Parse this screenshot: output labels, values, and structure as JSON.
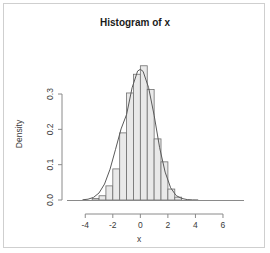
{
  "chart_data": {
    "type": "bar",
    "title": "Histogram of x",
    "xlabel": "x",
    "ylabel": "Density",
    "xlim": [
      -4.6,
      6.8
    ],
    "ylim": [
      0,
      0.385
    ],
    "grid": false,
    "legend": "none",
    "binwidth": 0.5,
    "xticks": [
      -4,
      -2,
      0,
      2,
      4,
      6
    ],
    "xticklabels": [
      "-4",
      "-2",
      "0",
      "2",
      "4",
      "6"
    ],
    "yticks": [
      0.0,
      0.1,
      0.2,
      0.3
    ],
    "yticklabels": [
      "0.0",
      "0.1",
      "0.2",
      "0.3"
    ],
    "bin_starts": [
      -3.5,
      -3.0,
      -2.5,
      -2.0,
      -1.5,
      -1.0,
      -0.5,
      0.0,
      0.5,
      1.0,
      1.5,
      2.0,
      2.5
    ],
    "bin_centers": [
      -3.25,
      -2.75,
      -2.25,
      -1.75,
      -1.25,
      -0.75,
      -0.25,
      0.25,
      0.75,
      1.25,
      1.75,
      2.25,
      2.75
    ],
    "values": [
      0.004,
      0.012,
      0.04,
      0.088,
      0.19,
      0.303,
      0.356,
      0.38,
      0.313,
      0.173,
      0.108,
      0.031,
      0.008
    ],
    "density_curve_label": "normal density overlay",
    "density_x": [
      -4.2,
      -3.8,
      -3.4,
      -3.0,
      -2.6,
      -2.2,
      -1.8,
      -1.4,
      -1.0,
      -0.6,
      -0.2,
      0.0,
      0.2,
      0.6,
      1.0,
      1.4,
      1.8,
      2.2,
      2.6,
      3.0,
      3.4,
      3.8,
      4.2
    ],
    "density_y": [
      0.0006,
      0.0023,
      0.0074,
      0.0199,
      0.0452,
      0.0873,
      0.1435,
      0.2012,
      0.242,
      0.3176,
      0.365,
      0.37,
      0.364,
      0.318,
      0.24,
      0.148,
      0.079,
      0.0345,
      0.0125,
      0.0044,
      0.0012,
      0.0003,
      0.0001
    ],
    "colors": {
      "bar_fill": "#e9e9e9",
      "bar_stroke": "#6f6f6f",
      "curve": "#5a5a5a",
      "axis": "#8a8a8a",
      "text": "#3a3a3a",
      "frame": "#cfcfcf",
      "background": "#ffffff"
    }
  }
}
